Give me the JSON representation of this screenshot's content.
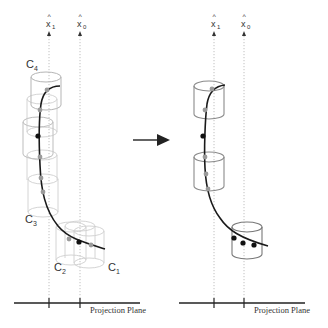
{
  "diagram": {
    "left_panel": {
      "axis_labels": [
        {
          "name": "x1-hat",
          "main": "x",
          "sub": "1",
          "hat": "^"
        },
        {
          "name": "x0-hat",
          "main": "x",
          "sub": "0",
          "hat": "^"
        }
      ],
      "cylinder_labels": [
        {
          "main": "C",
          "sub": "4"
        },
        {
          "main": "C",
          "sub": "3"
        },
        {
          "main": "C",
          "sub": "2"
        },
        {
          "main": "C",
          "sub": "1"
        }
      ],
      "projection_label": "Projection Plane"
    },
    "right_panel": {
      "axis_labels": [
        {
          "name": "x1-hat",
          "main": "x",
          "sub": "1",
          "hat": "^"
        },
        {
          "name": "x0-hat",
          "main": "x",
          "sub": "0",
          "hat": "^"
        }
      ],
      "projection_label": "Projection Plane"
    },
    "transition_arrow": "right-arrow",
    "colors": {
      "curve": "#1a1a1a",
      "faded_cylinder": "#c8c8c8",
      "solid_cylinder": "#8a8a8a",
      "gray_dot": "#9a9a9a",
      "black_dot": "#111111",
      "dotted_axis": "#b0b0b0"
    }
  }
}
